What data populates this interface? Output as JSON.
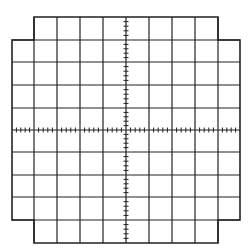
{
  "figure": {
    "type": "oscilloscope-graticule",
    "caption": "",
    "line_color": "#222222",
    "background": "#ffffff",
    "divisions": {
      "horizontal": 10,
      "vertical": 10
    },
    "minor_ticks_per_division": 5,
    "vertical_lines_x": [
      12,
      34,
      57,
      80,
      103,
      126,
      149,
      172,
      195,
      218,
      240
    ],
    "horizontal_lines_y": [
      17,
      40,
      62,
      85,
      108,
      130,
      152,
      175,
      197,
      220,
      243
    ],
    "inner_region": {
      "x1": 34,
      "x2": 218,
      "y1": 17,
      "y2": 243
    },
    "wide_region": {
      "x1": 12,
      "x2": 240,
      "y1": 40,
      "y2": 220
    },
    "axis_center": {
      "x": 126,
      "y": 130
    }
  }
}
